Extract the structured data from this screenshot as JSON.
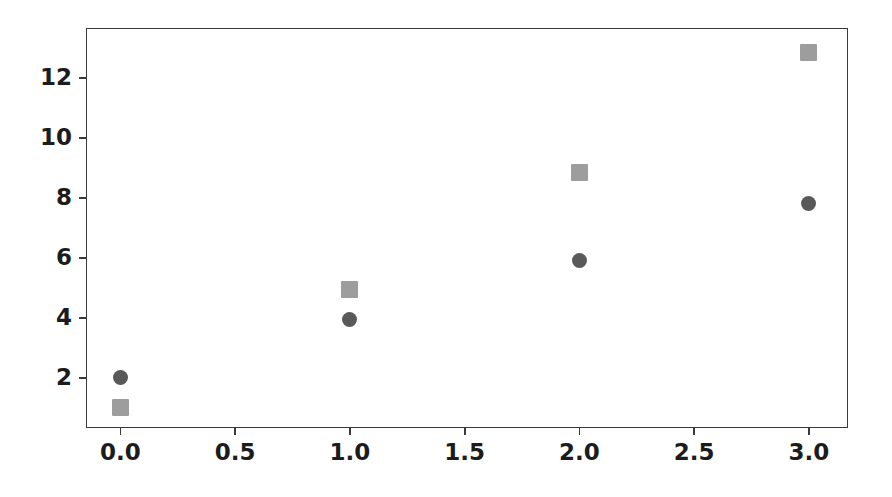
{
  "chart_data": {
    "type": "scatter",
    "title": "",
    "xlabel": "",
    "ylabel": "",
    "xlim": [
      -0.15,
      3.17
    ],
    "ylim": [
      0.33,
      13.67
    ],
    "grid": false,
    "legend": null,
    "x_ticks": [
      "0.0",
      "0.5",
      "1.0",
      "1.5",
      "2.0",
      "2.5",
      "3.0"
    ],
    "x_tick_values": [
      0.0,
      0.5,
      1.0,
      1.5,
      2.0,
      2.5,
      3.0
    ],
    "y_ticks": [
      "2",
      "4",
      "6",
      "8",
      "10",
      "12"
    ],
    "y_tick_values": [
      2,
      4,
      6,
      8,
      10,
      12
    ],
    "x": [
      0,
      1,
      2,
      3
    ],
    "series": [
      {
        "name": "circle-series",
        "marker": "circle",
        "color": "#595959",
        "size": 15,
        "values": [
          2.0,
          3.95,
          5.9,
          7.83
        ]
      },
      {
        "name": "square-series",
        "marker": "square",
        "color": "#9d9d9d",
        "size": 17,
        "values": [
          1.0,
          4.95,
          8.85,
          12.85
        ]
      }
    ]
  },
  "style": {
    "background": "#ffffff",
    "spine_color": "#3a3a3a",
    "tick_label_color": "#1c1c1c"
  }
}
